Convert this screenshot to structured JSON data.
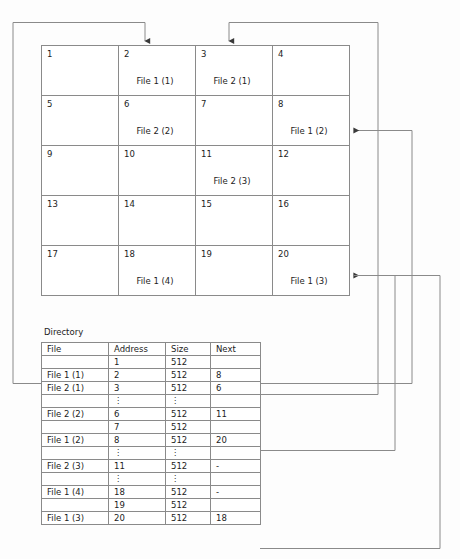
{
  "diagram": {
    "title_label": "Directory",
    "line_color": "#8a8a8a"
  },
  "disk": {
    "rows": 5,
    "cols": 4,
    "blocks": [
      {
        "num": "1",
        "file": ""
      },
      {
        "num": "2",
        "file": "File 1 (1)"
      },
      {
        "num": "3",
        "file": "File 2 (1)"
      },
      {
        "num": "4",
        "file": ""
      },
      {
        "num": "5",
        "file": ""
      },
      {
        "num": "6",
        "file": "File 2 (2)"
      },
      {
        "num": "7",
        "file": ""
      },
      {
        "num": "8",
        "file": "File 1 (2)"
      },
      {
        "num": "9",
        "file": ""
      },
      {
        "num": "10",
        "file": ""
      },
      {
        "num": "11",
        "file": "File 2 (3)"
      },
      {
        "num": "12",
        "file": ""
      },
      {
        "num": "13",
        "file": ""
      },
      {
        "num": "14",
        "file": ""
      },
      {
        "num": "15",
        "file": ""
      },
      {
        "num": "16",
        "file": ""
      },
      {
        "num": "17",
        "file": ""
      },
      {
        "num": "18",
        "file": "File 1 (4)"
      },
      {
        "num": "19",
        "file": ""
      },
      {
        "num": "20",
        "file": "File 1 (3)"
      }
    ]
  },
  "directory": {
    "headers": {
      "file": "File",
      "address": "Address",
      "size": "Size",
      "next": "Next"
    },
    "rows": [
      {
        "file": "",
        "address": "1",
        "size": "512",
        "next": ""
      },
      {
        "file": "File 1 (1)",
        "address": "2",
        "size": "512",
        "next": "8"
      },
      {
        "file": "File 2 (1)",
        "address": "3",
        "size": "512",
        "next": "6"
      },
      {
        "file": "",
        "address": "⋮",
        "size": "⋮",
        "next": "",
        "ellipsis": true
      },
      {
        "file": "File 2 (2)",
        "address": "6",
        "size": "512",
        "next": "11"
      },
      {
        "file": "",
        "address": "7",
        "size": "512",
        "next": ""
      },
      {
        "file": "File 1 (2)",
        "address": "8",
        "size": "512",
        "next": "20"
      },
      {
        "file": "",
        "address": "⋮",
        "size": "⋮",
        "next": "",
        "ellipsis": true
      },
      {
        "file": "File 2 (3)",
        "address": "11",
        "size": "512",
        "next": "-"
      },
      {
        "file": "",
        "address": "⋮",
        "size": "⋮",
        "next": "",
        "ellipsis": true
      },
      {
        "file": "File 1 (4)",
        "address": "18",
        "size": "512",
        "next": "-"
      },
      {
        "file": "",
        "address": "19",
        "size": "512",
        "next": ""
      },
      {
        "file": "File 1 (3)",
        "address": "20",
        "size": "512",
        "next": "18"
      }
    ]
  },
  "connectors": [
    {
      "name": "file1-start-to-block2",
      "from": "File 1 (1) directory row",
      "to": "block 2"
    },
    {
      "name": "file2-next6-to-block3",
      "from": "File 2 (1) next = 6",
      "to": "block 3"
    },
    {
      "name": "file1-next8-to-block8",
      "from": "File 1 (1) next = 8",
      "to": "block 8"
    },
    {
      "name": "file1-next20-to-block20",
      "from": "File 1 (2) next = 20",
      "to": "block 20"
    },
    {
      "name": "file1-next18-link",
      "from": "File 1 (3) next = 18",
      "to": "block 20 row"
    }
  ]
}
